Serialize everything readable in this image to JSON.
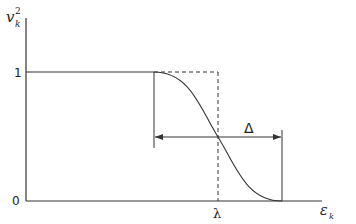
{
  "diagram": {
    "y_axis_label": "v",
    "y_axis_label_sub": "k",
    "y_axis_label_sup": "2",
    "x_axis_label": "ε",
    "x_axis_label_sub": "k",
    "y_tick_top": "1",
    "y_tick_bottom": "0",
    "x_marker_label": "λ",
    "width_label": "Δ",
    "colors": {
      "line": "#333333",
      "background": "#ffffff"
    }
  }
}
